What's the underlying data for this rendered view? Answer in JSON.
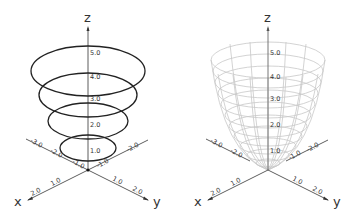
{
  "left_plot": {
    "title": "level curves (circles)",
    "axis_labels": {
      "x": "x",
      "y": "y",
      "z": "z"
    },
    "z_ticks": [
      "1.0",
      "2.0",
      "3.0",
      "4.0",
      "5.0"
    ],
    "x_ticks_neg": [
      "-1.0",
      "-2.0",
      "-3.0"
    ],
    "x_ticks_pos": [
      "1.0",
      "2.0"
    ],
    "y_ticks_pos": [
      "1.0",
      "2.0"
    ],
    "y_ticks_neg": [
      "-1.0",
      "-2.0"
    ],
    "curve_color": "#222222"
  },
  "right_plot": {
    "title": "paraboloid surface",
    "axis_labels": {
      "x": "x",
      "y": "y",
      "z": "z"
    },
    "z_ticks": [
      "1.0",
      "2.0",
      "3.0",
      "4.0",
      "5.0"
    ],
    "x_ticks_neg": [
      "-2.0",
      "-3.0"
    ],
    "x_ticks_pos": [
      "1.0",
      "2.0"
    ],
    "y_ticks_pos": [
      "1.0",
      "2.0"
    ],
    "y_ticks_neg": [
      "-1.0",
      "-2.0"
    ],
    "surface_color": "#c8c8c8"
  }
}
